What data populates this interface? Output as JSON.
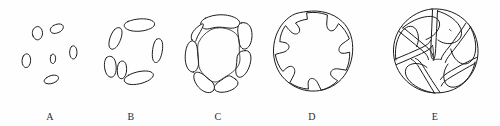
{
  "figure": {
    "background_color": "#fefefe",
    "ink_color": "#1c1c1c",
    "width": 500,
    "height": 126,
    "panel_count": 5
  },
  "panels": [
    {
      "label": "A",
      "name": "panel-a",
      "x": 10,
      "width": 80,
      "description": "six small separate ellipses arranged in a ring",
      "element_count": 6,
      "element_kind": "ellipse"
    },
    {
      "label": "B",
      "name": "panel-b",
      "x": 88,
      "width": 86,
      "description": "six elongated curved rods arranged in a ring",
      "element_count": 6,
      "element_kind": "rod"
    },
    {
      "label": "C",
      "name": "panel-c",
      "x": 172,
      "width": 92,
      "description": "six thick arc segments joined into a closed ring",
      "element_count": 6,
      "element_kind": "arc-segment"
    },
    {
      "label": "D",
      "name": "panel-d",
      "x": 262,
      "width": 100,
      "description": "continuous ring with six inward hooked notches",
      "element_count": 6,
      "element_kind": "hooked-notch"
    },
    {
      "label": "E",
      "name": "panel-e",
      "x": 380,
      "width": 110,
      "description": "pinwheel of six inward spiralling arms",
      "element_count": 6,
      "element_kind": "spiral-arm"
    }
  ]
}
